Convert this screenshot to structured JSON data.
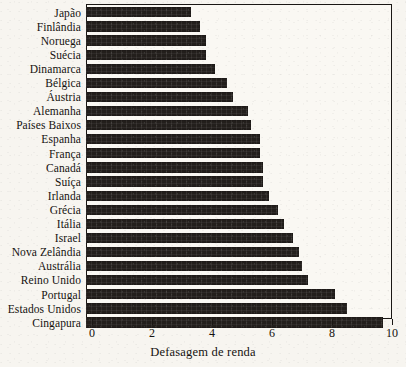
{
  "chart_data": {
    "type": "bar",
    "orientation": "horizontal",
    "title": "",
    "xlabel": "Defasagem de renda",
    "ylabel": "",
    "xlim": [
      0,
      10
    ],
    "xticks": [
      0,
      2,
      4,
      6,
      8,
      10
    ],
    "xtick_labels": [
      "0",
      "2",
      "4",
      "6",
      "8",
      "10"
    ],
    "grid": false,
    "legend": null,
    "categories": [
      "Japão",
      "Finlândia",
      "Noruega",
      "Suécia",
      "Dinamarca",
      "Bélgica",
      "Áustria",
      "Alemanha",
      "Países Baixos",
      "Espanha",
      "França",
      "Canadá",
      "Suíça",
      "Irlanda",
      "Grécia",
      "Itália",
      "Israel",
      "Nova Zelândia",
      "Austrália",
      "Reino Unido",
      "Portugal",
      "Estados Unidos",
      "Cingapura"
    ],
    "values": [
      3.3,
      3.6,
      3.8,
      3.8,
      4.1,
      4.5,
      4.7,
      5.2,
      5.3,
      5.6,
      5.6,
      5.7,
      5.7,
      5.9,
      6.2,
      6.4,
      6.7,
      6.9,
      7.0,
      7.2,
      8.1,
      8.5,
      9.7
    ],
    "colors": {
      "bar": "#231f1c",
      "axis": "#1a1714",
      "background": "#f7f5f0",
      "text": "#15120f"
    }
  }
}
